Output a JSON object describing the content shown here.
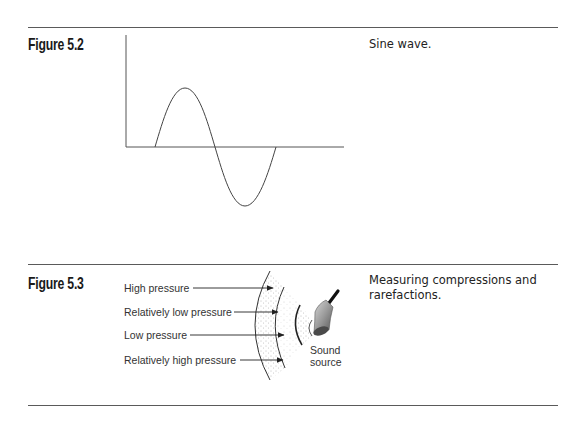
{
  "figures": [
    {
      "label": "Figure 5.2",
      "caption": "Sine wave.",
      "diagram": {
        "type": "sine-wave",
        "description": "One full sine cycle drawn above and below a horizontal axis with a vertical axis at left"
      }
    },
    {
      "label": "Figure 5.3",
      "caption": "Measuring compressions and rarefactions.",
      "diagram": {
        "type": "sound-wave-pressure",
        "pressure_labels": [
          "High pressure",
          "Relatively low pressure",
          "Low pressure",
          "Relatively high pressure"
        ],
        "source_label_line1": "Sound",
        "source_label_line2": "source"
      }
    }
  ],
  "colors": {
    "ink": "#1a1a1a",
    "rule": "#5a5a5a",
    "stipple": "#777777",
    "bell_body": "#8a8a8a"
  }
}
